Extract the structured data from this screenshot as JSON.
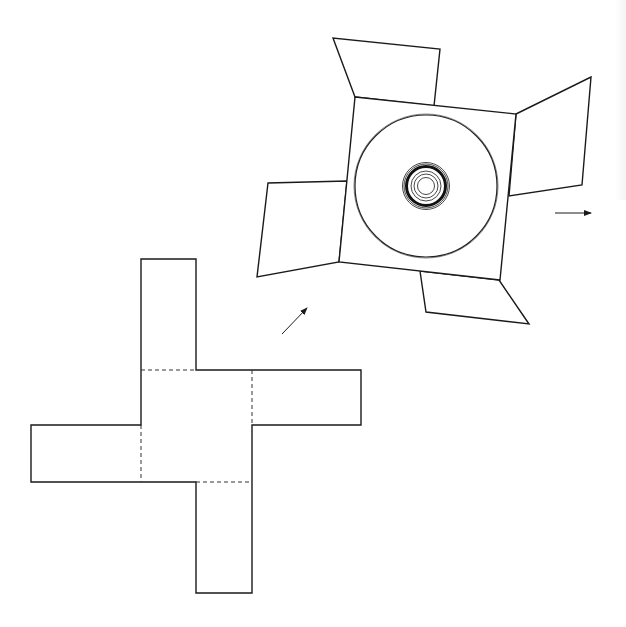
{
  "figure": {
    "colors": {
      "stroke": "#1a1a1a",
      "background": "#ffffff"
    },
    "cross_template": {
      "outline_points": "141,259 196,259 196,370 361,370 361,425 252,425 252,593 196,593 196,482 31,482 31,425 141,425",
      "fold_lines": [
        {
          "x1": 141,
          "y1": 370,
          "x2": 196,
          "y2": 370
        },
        {
          "x1": 252,
          "y1": 370,
          "x2": 252,
          "y2": 425
        },
        {
          "x1": 141,
          "y1": 425,
          "x2": 141,
          "y2": 482
        },
        {
          "x1": 196,
          "y1": 482,
          "x2": 252,
          "y2": 482
        }
      ]
    },
    "package": {
      "center_square": "355,97 516,114 500,280 339,262",
      "flaps": {
        "top": "355,97 333,38 440,49 434,106",
        "right": "516,114 591,77 582,185 509,196",
        "left": "347,181 268,183 257,277 339,262",
        "bottom": "420,271 426,312 529,324 499,280"
      },
      "disc": {
        "cx": 426,
        "cy": 186,
        "outer_r": 71,
        "hub_rings": [
          23.5,
          22
        ],
        "hub_thick_r": 19.5,
        "inner_rings": [
          15,
          12,
          8.5
        ]
      }
    },
    "arrows": [
      {
        "name": "diagonal-arrow",
        "x1": 282,
        "y1": 334,
        "x2": 307,
        "y2": 308
      },
      {
        "name": "right-arrow",
        "x1": 555,
        "y1": 213,
        "x2": 591,
        "y2": 213
      }
    ]
  }
}
